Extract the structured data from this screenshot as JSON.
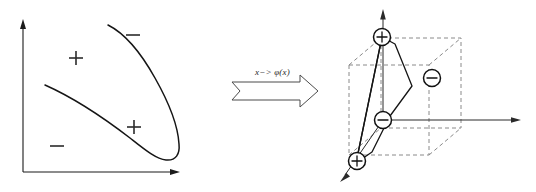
{
  "figure": {
    "background_color": "#ffffff",
    "ink_color": "#151515",
    "dashed_color": "#8a8a8a",
    "width": 536,
    "height": 192
  },
  "transform": {
    "label": "x−> φ(x)",
    "arrow_name": "block-arrow-right",
    "direction": "right"
  },
  "input_space": {
    "name": "input-space-plot",
    "axes": {
      "x_axis_label": "",
      "y_axis_label": "",
      "x_axis_arrow": true,
      "y_axis_arrow": true
    },
    "boundary": {
      "shape": "parabola",
      "description": "open parabolic decision boundary opening toward upper-left"
    },
    "markers": [
      {
        "sign": "+",
        "label": "+",
        "x": 76,
        "y": 58,
        "region": "inside-upper-left"
      },
      {
        "sign": "-",
        "label": "−",
        "x": 133,
        "y": 35,
        "region": "outside-upper-right"
      },
      {
        "sign": "+",
        "label": "+",
        "x": 134,
        "y": 127,
        "region": "inside-lower"
      },
      {
        "sign": "-",
        "label": "−",
        "x": 57,
        "y": 146,
        "region": "outside-lower-left"
      }
    ]
  },
  "feature_space": {
    "name": "feature-space-plot",
    "axes": {
      "vertical_axis_arrow": true,
      "horizontal_axis_arrow": true,
      "depth_axis_arrow": true
    },
    "cube": {
      "name": "unit-cube",
      "style": "dashed",
      "description": "wireframe cube drawn in dashed grey lines"
    },
    "separating_plane": {
      "name": "separating-plane",
      "style": "solid",
      "description": "solid quadrilateral plane slicing the cube, separating the plus points from the minus points"
    },
    "markers": [
      {
        "sign": "+",
        "label": "+",
        "x": 382,
        "y": 37,
        "region": "top-on-vertical-axis"
      },
      {
        "sign": "-",
        "label": "−",
        "x": 432,
        "y": 78,
        "region": "right-of-plane"
      },
      {
        "sign": "-",
        "label": "−",
        "x": 383,
        "y": 120,
        "region": "origin-area"
      },
      {
        "sign": "+",
        "label": "+",
        "x": 358,
        "y": 160,
        "region": "bottom-front-corner"
      }
    ]
  }
}
